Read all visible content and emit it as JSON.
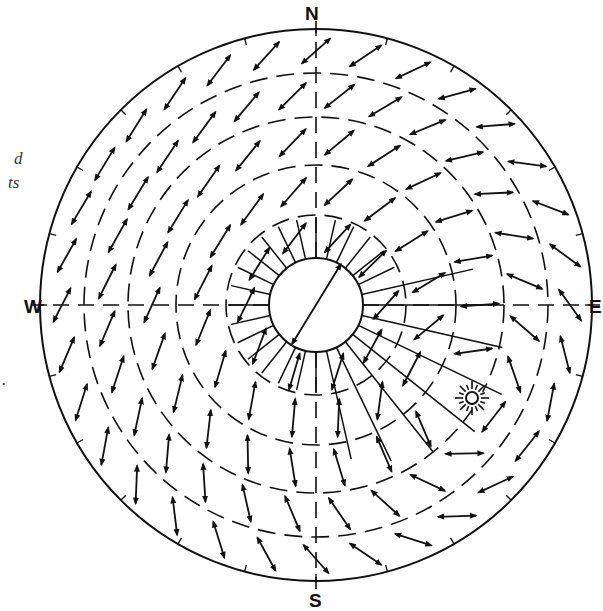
{
  "figure": {
    "type": "sky polarization pattern (celestial hemisphere)",
    "background": "#ffffff",
    "ink_color": "#111111"
  },
  "compass": {
    "north": {
      "label": "N",
      "x": 305,
      "y": 4
    },
    "south": {
      "label": "S",
      "x": 309,
      "y": 591
    },
    "west": {
      "label": "W",
      "x": 24,
      "y": 297
    },
    "east": {
      "label": "E",
      "x": 589,
      "y": 297
    }
  },
  "side_text_fragments": [
    {
      "text": "d",
      "x": 14,
      "y": 150
    },
    {
      "text": "ts",
      "x": 8,
      "y": 174
    },
    {
      "text": ".",
      "x": 2,
      "y": 371
    }
  ],
  "geometry": {
    "center": [
      316,
      305
    ],
    "outer_radius": 276,
    "zenith_circle_radius": 47,
    "altitude_rings": [
      90,
      140,
      188,
      232
    ],
    "meridian_axes": [
      "N-S",
      "W-E"
    ],
    "zenith_fan_lines": 28
  },
  "sun": {
    "label": "sun-symbol",
    "x": 472,
    "y": 398,
    "disk_radius": 6,
    "ray_count": 16
  },
  "e_vectors": {
    "description": "Double-headed arrows showing e-vector orientation, perpendicular to the great circle through the sun",
    "ring_radii": [
      70,
      115,
      164,
      210,
      254
    ],
    "per_ring_counts": [
      10,
      16,
      22,
      28,
      32
    ],
    "arrow_length": 38
  },
  "zenith_double_arrow": {
    "from": [
      292,
      344
    ],
    "to": [
      341,
      264
    ]
  }
}
